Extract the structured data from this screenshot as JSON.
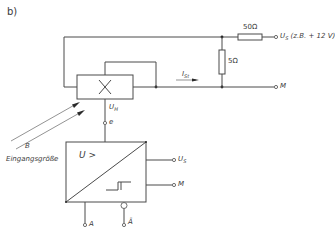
{
  "figure_label": "b)",
  "components": {
    "multiplier": {
      "symbol": "×"
    },
    "resistor_series": {
      "label": "50Ω"
    },
    "resistor_shunt": {
      "label": "5Ω"
    },
    "comparator": {
      "label": "U >"
    }
  },
  "labels": {
    "supply": "U",
    "supply_sub": "S",
    "supply_note": "(z.B. + 12 V)",
    "ground_top": "M",
    "current": "I",
    "current_sub": "St",
    "hall_voltage": "U",
    "hall_voltage_sub": "H",
    "node_e": "e",
    "field": "B",
    "input_quantity": "Eingangsgröße",
    "comp_supply": "U",
    "comp_supply_sub": "S",
    "comp_ground": "M",
    "output_a": "A",
    "output_a_bar": "Ā"
  }
}
